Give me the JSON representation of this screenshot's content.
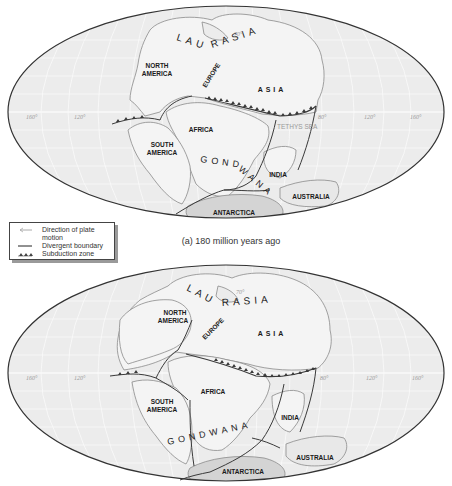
{
  "figure": {
    "caption_a": "(a) 180 million years ago",
    "colors": {
      "ocean": "#ececec",
      "grid": "#ffffff",
      "continent": "#f4f4f4",
      "continent_outline": "#8a8a8a",
      "antarctica": "#d4d4d4",
      "boundary": "#3a3a3a",
      "frame": "#333333"
    }
  },
  "legend": {
    "items": [
      {
        "symbol": "arrow",
        "label_line1": "Direction of plate",
        "label_line2": "motion"
      },
      {
        "symbol": "line",
        "label_line1": "Divergent boundary"
      },
      {
        "symbol": "triangles",
        "label_line1": "Subduction zone"
      }
    ]
  },
  "map_a": {
    "supercontinents": {
      "north": "LAURASIA",
      "south": "GONDWANA"
    },
    "continents": {
      "north_america_1": "NORTH",
      "north_america_2": "AMERICA",
      "europe": "EUROPE",
      "asia": "ASIA",
      "africa": "AFRICA",
      "south_america_1": "SOUTH",
      "south_america_2": "AMERICA",
      "india": "INDIA",
      "australia": "AUSTRALIA",
      "antarctica": "ANTARCTICA"
    },
    "sea": "TETHYS SEA",
    "graticule": {
      "lat_top": "70°",
      "west_1": "160°",
      "west_2": "120°",
      "east_1": "80°",
      "east_2": "120°",
      "east_3": "160°"
    }
  },
  "map_b": {
    "supercontinents": {
      "north": "LAURASIA",
      "south": "GONDWANA"
    },
    "continents": {
      "north_america_1": "NORTH",
      "north_america_2": "AMERICA",
      "europe": "EUROPE",
      "asia": "ASIA",
      "africa": "AFRICA",
      "south_america_1": "SOUTH",
      "south_america_2": "AMERICA",
      "india": "INDIA",
      "australia": "AUSTRALIA",
      "antarctica": "ANTARCTICA"
    },
    "graticule": {
      "lat_top": "70°",
      "west_1": "160°",
      "west_2": "120°",
      "east_1": "80°",
      "east_2": "120°",
      "east_3": "160°"
    }
  }
}
